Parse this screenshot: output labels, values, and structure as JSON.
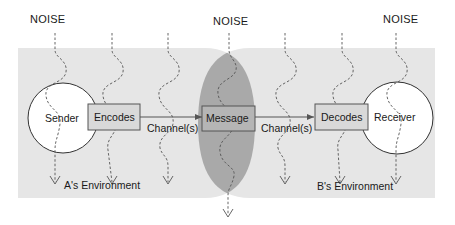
{
  "diagram": {
    "noise_labels": [
      "NOISE",
      "NOISE",
      "NOISE"
    ],
    "sender": "Sender",
    "receiver": "Receiver",
    "encodes": "Encodes",
    "decodes": "Decodes",
    "message": "Message",
    "channel_left": "Channel(s)",
    "channel_right": "Channel(s)",
    "env_a": "A's Environment",
    "env_b": "B's Environment"
  },
  "colors": {
    "background": "#ffffff",
    "environment": "#e6e6e6",
    "overlap": "#a9a9a9",
    "box_fill": "#d9d9d9",
    "box_stroke": "#555555",
    "line": "#444444",
    "text": "#1a1a1a"
  }
}
